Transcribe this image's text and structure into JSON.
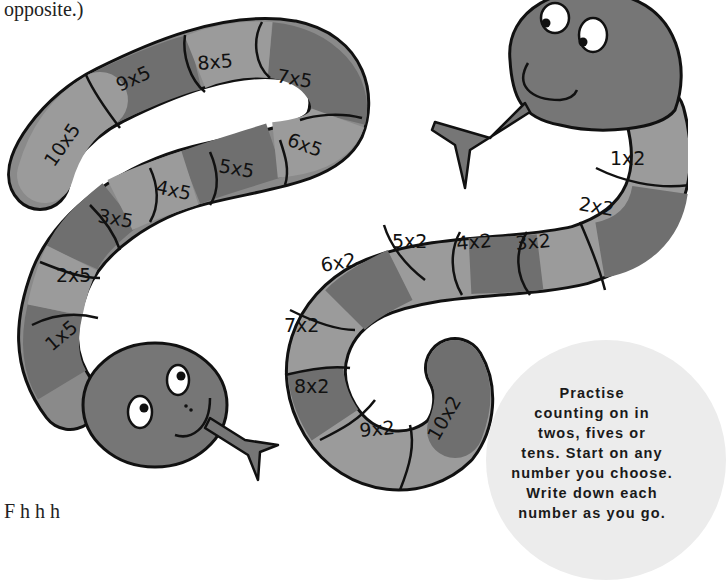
{
  "page": {
    "top_text": "opposite.)",
    "bottom_text": "F                          h     h   h"
  },
  "colors": {
    "segment_light": "#9b9b9b",
    "segment_dark": "#6f6f6f",
    "head": "#767676",
    "outline": "#111111",
    "tip_bg": "#ececec"
  },
  "snake_fives": {
    "name": "Five times table snake",
    "segments": [
      "1x5",
      "2x5",
      "3x5",
      "4x5",
      "5x5",
      "6x5",
      "7x5",
      "8x5",
      "9x5",
      "10x5"
    ]
  },
  "snake_twos": {
    "name": "Two times table snake",
    "segments": [
      "1x2",
      "2x2",
      "3x2",
      "4x2",
      "5x2",
      "6x2",
      "7x2",
      "8x2",
      "9x2",
      "10x2"
    ]
  },
  "tip": {
    "lines": [
      "Practise",
      "counting on in",
      "twos, fives or",
      "tens. Start on any",
      "number you choose.",
      "Write down each",
      "number as you go."
    ]
  }
}
